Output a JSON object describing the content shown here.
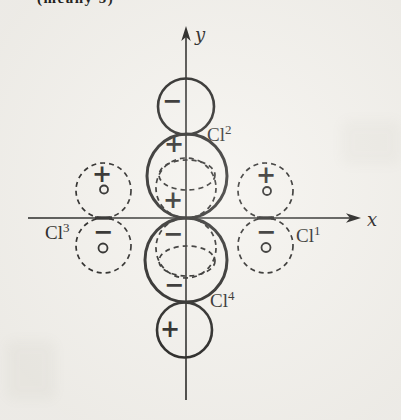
{
  "figure": {
    "header_fragment": "(meany 5)",
    "axes": {
      "x_label": "x",
      "y_label": "y"
    },
    "labels": {
      "cl1_base": "Cl",
      "cl1_sup": "1",
      "cl2_base": "Cl",
      "cl2_sup": "2",
      "cl3_base": "Cl",
      "cl3_sup": "3",
      "cl4_base": "Cl",
      "cl4_sup": "4"
    },
    "signs": {
      "top_circle": "−",
      "upper_lobe_top": "+",
      "upper_lobe_bottom": "+",
      "lower_lobe_top": "−",
      "lower_lobe_bottom": "−",
      "bottom_circle": "+",
      "left_upper_plus": "+",
      "left_lower_minus": "−",
      "right_upper_plus": "+",
      "right_lower_minus": "−"
    },
    "symbols": {
      "small_circle_marker": "open circle (o) phase marker inside each dashed loop"
    },
    "colors": {
      "ink": "#1d1c1a",
      "paper": "#f4f2ed"
    }
  }
}
